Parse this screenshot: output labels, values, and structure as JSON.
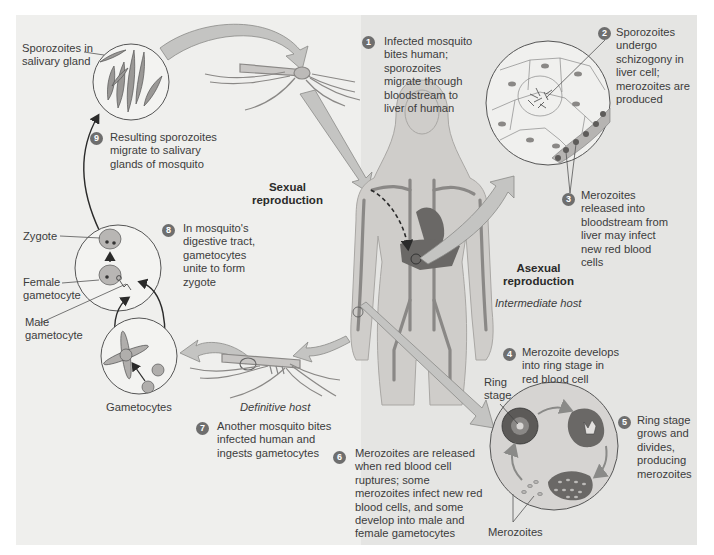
{
  "figure": {
    "type": "life-cycle diagram",
    "regions": {
      "sexual": {
        "title": "Sexual\nreproduction",
        "host": "Definitive host"
      },
      "asexual": {
        "title": "Asexual\nreproduction",
        "host": "Intermediate host"
      }
    },
    "steps": [
      {
        "number": "1",
        "text": "Infected mosquito\nbites human;\nsporozoites\nmigrate through\nbloodstream to\nliver of human"
      },
      {
        "number": "2",
        "text": "Sporozoites\nundergo\nschizogony in\nliver cell;\nmerozoites are\nproduced"
      },
      {
        "number": "3",
        "text": "Merozoites\nreleased into\nbloodstream from\nliver may infect\nnew red blood\ncells"
      },
      {
        "number": "4",
        "text": "Merozoite develops\ninto ring stage in\nred blood cell"
      },
      {
        "number": "5",
        "text": "Ring stage\ngrows and\ndivides,\nproducing\nmerozoites"
      },
      {
        "number": "6",
        "text": "Merozoites are released\nwhen red blood cell\nruptures; some\nmerozoites infect new red\nblood cells, and some\ndevelop into male and\nfemale gametocytes"
      },
      {
        "number": "7",
        "text": "Another mosquito bites\ninfected human and\ningests gametocytes"
      },
      {
        "number": "8",
        "text": "In mosquito's\ndigestive tract,\ngametocytes\nunite to form\nzygote"
      },
      {
        "number": "9",
        "text": "Resulting sporozoites\nmigrate to salivary\nglands of mosquito"
      }
    ],
    "labels": {
      "sporozoites_gland": "Sporozoites in\nsalivary gland",
      "zygote": "Zygote",
      "female_gametocyte": "Female\ngametocyte",
      "male_gametocyte": "Male\ngametocyte",
      "gametocytes": "Gametocytes",
      "ring_stage": "Ring\nstage",
      "merozoites": "Merozoites"
    },
    "colors": {
      "panel_left": "#efefed",
      "panel_right": "#e5e5e3",
      "badge": "#6e6e6e",
      "arrow_fill": "#c4c4c2",
      "body_fill": "#cfcdca",
      "vessel": "#8a8886",
      "organ": "#6a6866"
    }
  }
}
